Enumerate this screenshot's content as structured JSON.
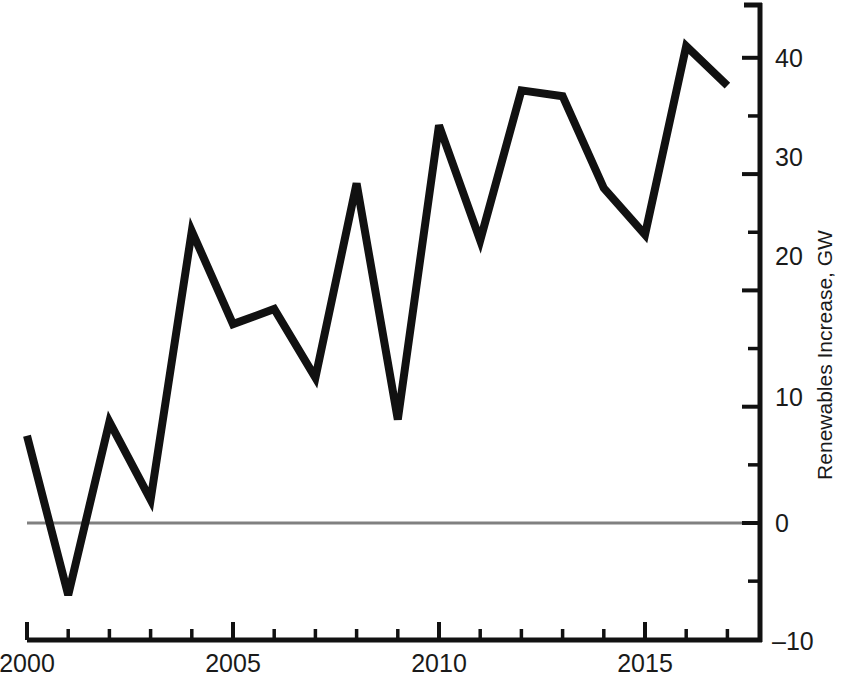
{
  "chart_data": {
    "type": "line",
    "title": "",
    "xlabel": "",
    "ylabel": "Renewables Increase, GW",
    "x": [
      2000,
      2001,
      2002,
      2003,
      2004,
      2005,
      2006,
      2007,
      2008,
      2009,
      2010,
      2011,
      2012,
      2013,
      2014,
      2015,
      2016,
      2017
    ],
    "values": [
      7.5,
      -6.2,
      8.7,
      2.0,
      25.1,
      17.1,
      18.4,
      12.5,
      29.2,
      8.9,
      34.2,
      24.3,
      37.2,
      36.7,
      28.8,
      24.8,
      41.0,
      37.6
    ],
    "series": [
      {
        "name": "Renewables Increase",
        "color": "#111111",
        "values": [
          7.5,
          -6.2,
          8.7,
          2.0,
          25.1,
          17.1,
          18.4,
          12.5,
          29.2,
          8.9,
          34.2,
          24.3,
          37.2,
          36.7,
          28.8,
          24.8,
          41.0,
          37.6
        ]
      }
    ],
    "xlim": [
      2000,
      2017.8
    ],
    "ylim": [
      -10,
      44
    ],
    "grid": false,
    "legend": false,
    "legend_position": "none",
    "y_axis_side": "right",
    "x_tick_labels": [
      "2000",
      "2005",
      "2010",
      "2015"
    ],
    "x_major_ticks": [
      2000,
      2005,
      2010,
      2015
    ],
    "x_minor_ticks": [
      2001,
      2002,
      2003,
      2004,
      2006,
      2007,
      2008,
      2009,
      2011,
      2012,
      2013,
      2014,
      2016,
      2017
    ],
    "y_tick_labels": [
      "40",
      "30",
      "20",
      "10",
      "0",
      "-10"
    ],
    "y_major_ticks": [
      40,
      30,
      20,
      10,
      0,
      -10
    ],
    "y_minor_ticks": [
      35,
      25,
      15,
      5,
      -5
    ],
    "zero_line": {
      "value": 0,
      "color": "#808080"
    },
    "line_color": "#111111",
    "axis_color": "#111111",
    "background_color": "#ffffff"
  },
  "axis": {
    "y_title": "Renewables Increase, GW"
  },
  "ticks": {
    "x": [
      {
        "label": "2000"
      },
      {
        "label": "2005"
      },
      {
        "label": "2010"
      },
      {
        "label": "2015"
      }
    ],
    "y": [
      {
        "label": "40"
      },
      {
        "label": "30"
      },
      {
        "label": "20"
      },
      {
        "label": "10"
      },
      {
        "label": "0"
      },
      {
        "label": "–10"
      }
    ]
  }
}
